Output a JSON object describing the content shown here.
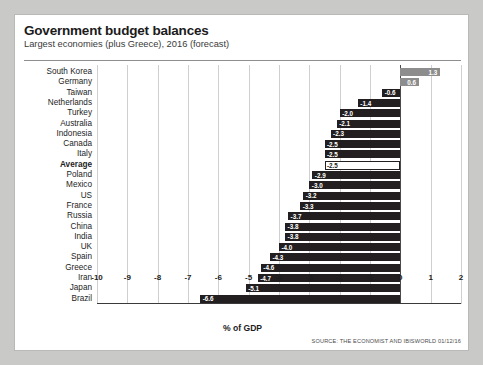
{
  "header": {
    "title": "Government budget balances",
    "subtitle": "Largest economies (plus Greece), 2016 (forecast)"
  },
  "footer": {
    "source": "SOURCE: THE ECONOMIST AND IBISWORLD 01/12/16"
  },
  "chart_data": {
    "type": "bar",
    "orientation": "horizontal",
    "title": "Government budget balances",
    "subtitle": "Largest economies (plus Greece), 2016 (forecast)",
    "xlabel": "% of GDP",
    "ylabel": "",
    "xlim": [
      -10,
      2
    ],
    "xticks": [
      "-10",
      "-9",
      "-8",
      "-7",
      "-6",
      "-5",
      "-4",
      "-3",
      "-2",
      "-1",
      "0",
      "1",
      "2"
    ],
    "xtick_values": [
      -10,
      -9,
      -8,
      -7,
      -6,
      -5,
      -4,
      -3,
      -2,
      -1,
      0,
      1,
      2
    ],
    "grid": true,
    "legend": "none",
    "colors": {
      "negative_bar": "#231f20",
      "positive_bar": "#8d8d8d",
      "average_bar": "#ffffff",
      "average_bar_border": "#231f20",
      "panel_background": "#ffffff",
      "page_background": "#c9c9c7"
    },
    "categories": [
      "South Korea",
      "Germany",
      "Taiwan",
      "Netherlands",
      "Turkey",
      "Australia",
      "Indonesia",
      "Canada",
      "Italy",
      "Average",
      "Poland",
      "Mexico",
      "US",
      "France",
      "Russia",
      "China",
      "India",
      "UK",
      "Spain",
      "Greece",
      "Iran",
      "Japan",
      "Brazil"
    ],
    "values": [
      1.3,
      0.6,
      -0.6,
      -1.4,
      -2.0,
      -2.1,
      -2.3,
      -2.5,
      -2.5,
      -2.5,
      -2.9,
      -3.0,
      -3.2,
      -3.3,
      -3.7,
      -3.8,
      -3.8,
      -4.0,
      -4.3,
      -4.6,
      -4.7,
      -5.1,
      -6.6
    ],
    "data_labels": [
      "1.3",
      "0.6",
      "-0.6",
      "-1.4",
      "-2.0",
      "-2.1",
      "-2.3",
      "-2.5",
      "-2.5",
      "-2.5",
      "-2.9",
      "-3.0",
      "-3.2",
      "-3.3",
      "-3.7",
      "-3.8",
      "-3.8",
      "-4.0",
      "-4.3",
      "-4.6",
      "-4.7",
      "-5.1",
      "-6.6"
    ],
    "highlight": {
      "category": "Average",
      "style": "white-filled-outlined-bar-bold-label"
    }
  }
}
